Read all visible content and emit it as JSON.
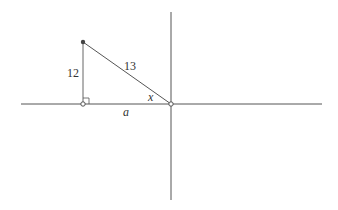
{
  "diagram": {
    "type": "right-triangle-on-axes",
    "labels": {
      "vertical_leg": "12",
      "hypotenuse": "13",
      "horizontal_leg": "a",
      "angle": "x"
    },
    "colors": {
      "line": "#555555",
      "point": "#444444",
      "background": "#ffffff"
    }
  }
}
